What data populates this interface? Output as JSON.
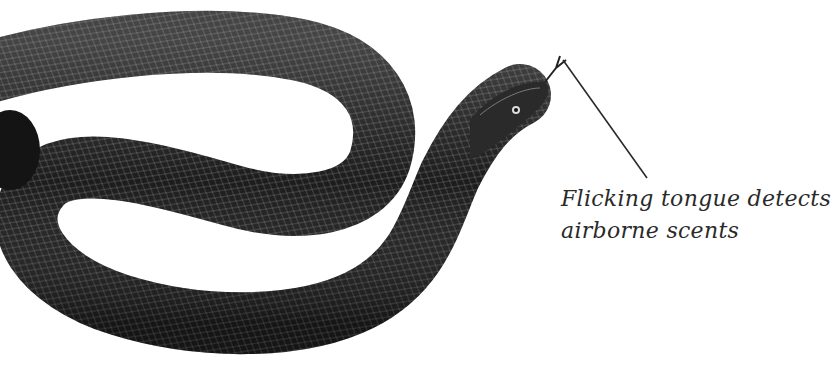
{
  "annotation": {
    "line1": "Flicking tongue detects",
    "line2": "airborne scents"
  },
  "colors": {
    "background": "#ffffff",
    "snake_body": "#1c1c1c",
    "scale_highlight": "#8a8a8a",
    "leader_line": "#2a2a2a",
    "text": "#2a2a2a"
  }
}
